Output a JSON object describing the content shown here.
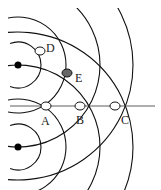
{
  "diagram": {
    "sources": [
      {
        "name": "source-1",
        "x": 18,
        "y": 65
      },
      {
        "name": "source-2",
        "x": 18,
        "y": 147
      }
    ],
    "points": [
      {
        "label": "D",
        "x": 40,
        "y": 51,
        "filled": false,
        "lx": 46,
        "ly": 52
      },
      {
        "label": "E",
        "x": 67,
        "y": 73,
        "filled": true,
        "lx": 75,
        "ly": 82
      },
      {
        "label": "A",
        "x": 46,
        "y": 106,
        "filled": false,
        "lx": 41,
        "ly": 125
      },
      {
        "label": "B",
        "x": 80,
        "y": 106,
        "filled": false,
        "lx": 76,
        "ly": 124
      },
      {
        "label": "C",
        "x": 115,
        "y": 106,
        "filled": false,
        "lx": 121,
        "ly": 124
      }
    ],
    "radii": [
      23,
      48,
      82,
      115
    ],
    "centerline_y": 106
  }
}
